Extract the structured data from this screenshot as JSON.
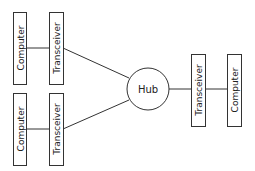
{
  "diagram": {
    "type": "star-network",
    "hub": {
      "label": "Hub",
      "cx": 148,
      "cy": 89,
      "r": 21
    },
    "nodes": [
      {
        "id": "computer-top-left",
        "label": "Computer",
        "x": 13,
        "y": 12,
        "w": 13,
        "h": 72
      },
      {
        "id": "transceiver-top-left",
        "label": "Transceiver",
        "x": 49,
        "y": 12,
        "w": 14,
        "h": 72
      },
      {
        "id": "computer-bottom-left",
        "label": "Computer",
        "x": 13,
        "y": 93,
        "w": 13,
        "h": 72
      },
      {
        "id": "transceiver-bottom-left",
        "label": "Transceiver",
        "x": 49,
        "y": 93,
        "w": 14,
        "h": 72
      },
      {
        "id": "transceiver-right",
        "label": "Transceiver",
        "x": 191,
        "y": 54,
        "w": 14,
        "h": 72
      },
      {
        "id": "computer-right",
        "label": "Computer",
        "x": 227,
        "y": 54,
        "w": 14,
        "h": 72
      }
    ],
    "edges": [
      {
        "from": "computer-top-left",
        "to": "transceiver-top-left"
      },
      {
        "from": "transceiver-top-left",
        "to": "hub"
      },
      {
        "from": "computer-bottom-left",
        "to": "transceiver-bottom-left"
      },
      {
        "from": "transceiver-bottom-left",
        "to": "hub"
      },
      {
        "from": "hub",
        "to": "transceiver-right"
      },
      {
        "from": "transceiver-right",
        "to": "computer-right"
      }
    ]
  },
  "labels": {
    "computer": "Computer",
    "transceiver": "Transceiver",
    "hub": "Hub"
  }
}
